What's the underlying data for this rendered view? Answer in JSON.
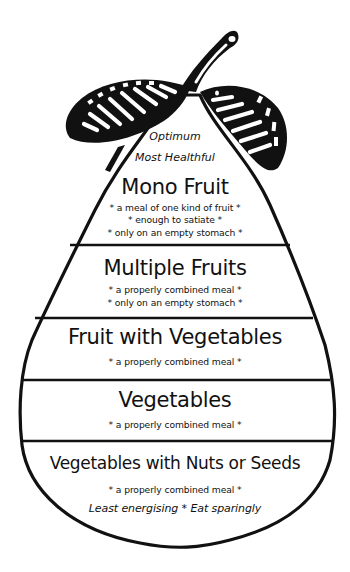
{
  "diagram": {
    "shape": "pear",
    "colors": {
      "outline": "#111111",
      "background": "#ffffff",
      "text": "#111111"
    },
    "top_labels": {
      "line1": "Optimum",
      "line2": "Most Healthful"
    },
    "tiers": [
      {
        "title": "Mono Fruit",
        "notes": [
          "* a meal of one kind of fruit *",
          "* enough to satiate *",
          "* only on an empty stomach *"
        ]
      },
      {
        "title": "Multiple Fruits",
        "notes": [
          "* a properly combined meal *",
          "* only on an empty stomach *"
        ]
      },
      {
        "title": "Fruit with Vegetables",
        "notes": [
          "* a properly combined meal *"
        ]
      },
      {
        "title": "Vegetables",
        "notes": [
          "* a properly combined meal *"
        ]
      },
      {
        "title": "Vegetables with Nuts or Seeds",
        "notes": [
          "* a properly combined meal *"
        ],
        "footer": "Least energising * Eat sparingly"
      }
    ],
    "icons": [
      "pear-outline",
      "pear-leaf-left",
      "pear-leaf-right",
      "pear-stem"
    ]
  }
}
